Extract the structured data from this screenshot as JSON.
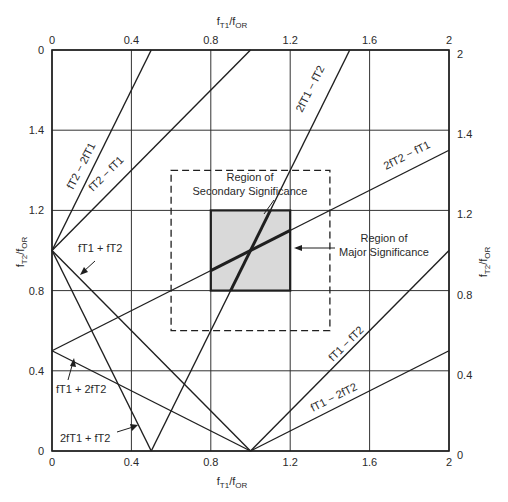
{
  "chart_data": {
    "type": "line",
    "title": "",
    "xlabel": "fT1/fOR",
    "ylabel": "fT2/fOR",
    "xlim": [
      0,
      2
    ],
    "ylim": [
      0,
      2
    ],
    "grid": true,
    "x_ticks": [
      0,
      0.4,
      0.8,
      1.2,
      1.6,
      2
    ],
    "x_tick_labels": [
      "0",
      "0.4",
      "0.8",
      "1.2",
      "1.6",
      "2"
    ],
    "y_ticks": [
      0,
      0.4,
      0.8,
      1.2,
      1.6,
      2
    ],
    "y_tick_labels_left": [
      "0",
      "0.4",
      "0.8",
      "1.2",
      "1.4",
      "0"
    ],
    "y_tick_labels_right": [
      "0",
      "0.4",
      "0.8",
      "1.2",
      "1.4",
      "2"
    ],
    "series": [
      {
        "name": "fT1 + fT2",
        "x": [
          0,
          1
        ],
        "y": [
          1,
          0
        ]
      },
      {
        "name": "2fT1 + fT2",
        "x": [
          0,
          0.5
        ],
        "y": [
          1,
          0
        ]
      },
      {
        "name": "fT1 + 2fT2",
        "x": [
          0,
          1
        ],
        "y": [
          0.5,
          0
        ]
      },
      {
        "name": "fT2 - fT1",
        "x": [
          0,
          1
        ],
        "y": [
          1,
          2
        ]
      },
      {
        "name": "fT2 - 2fT1",
        "x": [
          0,
          0.5
        ],
        "y": [
          1,
          2
        ]
      },
      {
        "name": "2fT1 - fT2",
        "x": [
          0.5,
          1.5
        ],
        "y": [
          0,
          2
        ]
      },
      {
        "name": "2fT2 - fT1",
        "x": [
          0,
          2
        ],
        "y": [
          0.5,
          1.5
        ]
      },
      {
        "name": "fT1 - fT2",
        "x": [
          1,
          2
        ],
        "y": [
          0,
          1
        ]
      },
      {
        "name": "fT1 - 2fT2",
        "x": [
          1,
          2
        ],
        "y": [
          0,
          0.5
        ]
      }
    ],
    "regions": [
      {
        "name": "Region of Major Significance",
        "x": [
          0.8,
          1.2
        ],
        "y": [
          0.8,
          1.2
        ],
        "style": "shaded-solid"
      },
      {
        "name": "Region of Secondary Significance",
        "x": [
          0.6,
          1.4
        ],
        "y": [
          0.6,
          1.4
        ],
        "style": "dashed"
      }
    ]
  },
  "axes": {
    "top_label": {
      "main": "f",
      "sub1": "T1",
      "slash": "/f",
      "sub2": "OR"
    },
    "bottom_label": {
      "main": "f",
      "sub1": "T1",
      "slash": "/f",
      "sub2": "OR"
    },
    "left_label": {
      "main": "f",
      "sub1": "T2",
      "slash": "/f",
      "sub2": "OR"
    },
    "right_label": {
      "main": "f",
      "sub1": "T2",
      "slash": "/f",
      "sub2": "OR"
    }
  },
  "annotations": {
    "secondary_region": [
      "Region of",
      "Secondary Significance"
    ],
    "major_region": [
      "Region of",
      "Major Significance"
    ],
    "line_labels": {
      "fT2_minus_2fT1": "fT2 − 2fT1",
      "fT2_minus_fT1": "fT2 − fT1",
      "2fT1_minus_fT2": "2fT1 − fT2",
      "2fT2_minus_fT1": "2fT2 − fT1",
      "fT1_plus_fT2": "fT1 + fT2",
      "fT1_plus_2fT2": "fT1 + 2fT2",
      "2fT1_plus_fT2": "2fT1 + fT2",
      "fT1_minus_fT2": "fT1 − fT2",
      "fT1_minus_2fT2": "fT1 − 2fT2"
    }
  },
  "colors": {
    "line": "#1f1f1f",
    "grid": "#333333",
    "shade": "#d9d9d9",
    "text": "#2a2a2a"
  }
}
